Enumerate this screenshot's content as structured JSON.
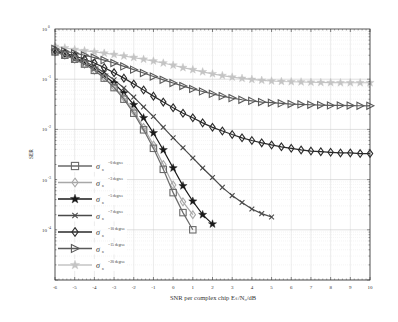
{
  "chart_data": {
    "type": "line",
    "title": "",
    "xlabel": "SNR per complex chip Eₛ/N₀/dB",
    "ylabel": "SER",
    "xlim": [
      -6,
      10
    ],
    "ylim": [
      1e-05,
      1
    ],
    "yscale": "log",
    "grid": true,
    "legend_position": "lower left",
    "x_ticks": [
      -6,
      -5,
      -4,
      -3,
      -2,
      -1,
      0,
      1,
      2,
      3,
      4,
      5,
      6,
      7,
      8,
      9,
      10
    ],
    "y_ticks": [
      {
        "value": 1,
        "label": "10",
        "exp": "0"
      },
      {
        "value": 0.1,
        "label": "10",
        "exp": "-1"
      },
      {
        "value": 0.01,
        "label": "10",
        "exp": "-2"
      },
      {
        "value": 0.001,
        "label": "10",
        "exp": "-3"
      },
      {
        "value": 0.0001,
        "label": "10",
        "exp": "-4"
      }
    ],
    "series": [
      {
        "name": "σₙ =0 degree",
        "sigma": "0",
        "marker": "square",
        "color": "#6a6a6a",
        "x": [
          -6,
          -5.5,
          -5,
          -4.5,
          -4,
          -3.5,
          -3,
          -2.5,
          -2,
          -1.5,
          -1,
          -0.5,
          0,
          0.5,
          1
        ],
        "values": [
          0.35,
          0.3,
          0.25,
          0.2,
          0.15,
          0.105,
          0.068,
          0.04,
          0.021,
          0.0098,
          0.0042,
          0.0016,
          0.00055,
          0.00022,
          0.0001
        ]
      },
      {
        "name": "σₙ =3 degree",
        "sigma": "3",
        "marker": "diamond",
        "color": "#a8a8a8",
        "x": [
          -6,
          -5.5,
          -5,
          -4.5,
          -4,
          -3.5,
          -3,
          -2.5,
          -2,
          -1.5,
          -1,
          -0.5,
          0,
          0.5,
          1
        ],
        "values": [
          0.35,
          0.3,
          0.25,
          0.2,
          0.15,
          0.108,
          0.071,
          0.043,
          0.023,
          0.011,
          0.0049,
          0.002,
          0.00078,
          0.00036,
          0.0002
        ]
      },
      {
        "name": "σₙ =5 degree",
        "sigma": "5",
        "marker": "star",
        "color": "#1a1a1a",
        "x": [
          -6,
          -5.5,
          -5,
          -4.5,
          -4,
          -3.5,
          -3,
          -2.5,
          -2,
          -1.5,
          -1,
          -0.5,
          0,
          0.5,
          1,
          1.5,
          2
        ],
        "values": [
          0.36,
          0.31,
          0.26,
          0.21,
          0.165,
          0.12,
          0.083,
          0.053,
          0.031,
          0.017,
          0.0085,
          0.0039,
          0.0017,
          0.00075,
          0.00037,
          0.0002,
          0.00013
        ]
      },
      {
        "name": "σₙ =7 degree",
        "sigma": "7",
        "marker": "x",
        "color": "#4a4a4a",
        "x": [
          -6,
          -5.5,
          -5,
          -4.5,
          -4,
          -3.5,
          -3,
          -2.5,
          -2,
          -1.5,
          -1,
          -0.5,
          0,
          0.5,
          1,
          1.5,
          2,
          2.5,
          3,
          3.5,
          4,
          4.5,
          5
        ],
        "values": [
          0.37,
          0.32,
          0.27,
          0.225,
          0.18,
          0.135,
          0.097,
          0.067,
          0.044,
          0.028,
          0.018,
          0.011,
          0.0068,
          0.0043,
          0.0027,
          0.0017,
          0.0011,
          0.0007,
          0.00048,
          0.00035,
          0.00026,
          0.00021,
          0.00018
        ]
      },
      {
        "name": "σₙ =10 degree",
        "sigma": "10",
        "marker": "diamond-open",
        "color": "#2a2a2a",
        "x": [
          -6,
          -5.5,
          -5,
          -4.5,
          -4,
          -3.5,
          -3,
          -2.5,
          -2,
          -1.5,
          -1,
          -0.5,
          0,
          0.5,
          1,
          1.5,
          2,
          2.5,
          3,
          3.5,
          4,
          4.5,
          5,
          5.5,
          6,
          6.5,
          7,
          7.5,
          8,
          8.5,
          9,
          9.5,
          10
        ],
        "values": [
          0.37,
          0.33,
          0.29,
          0.25,
          0.21,
          0.17,
          0.135,
          0.105,
          0.08,
          0.061,
          0.046,
          0.035,
          0.027,
          0.021,
          0.017,
          0.0135,
          0.011,
          0.0093,
          0.0079,
          0.0068,
          0.006,
          0.0054,
          0.0049,
          0.0045,
          0.0042,
          0.0039,
          0.0037,
          0.0036,
          0.0035,
          0.0034,
          0.0034,
          0.0033,
          0.0033
        ]
      },
      {
        "name": "σₙ =15 degree",
        "sigma": "15",
        "marker": "triangle-right",
        "color": "#5a5a5a",
        "x": [
          -6,
          -5.5,
          -5,
          -4.5,
          -4,
          -3.5,
          -3,
          -2.5,
          -2,
          -1.5,
          -1,
          -0.5,
          0,
          0.5,
          1,
          1.5,
          2,
          2.5,
          3,
          3.5,
          4,
          4.5,
          5,
          5.5,
          6,
          6.5,
          7,
          7.5,
          8,
          8.5,
          9,
          9.5,
          10
        ],
        "values": [
          0.4,
          0.36,
          0.33,
          0.3,
          0.27,
          0.24,
          0.21,
          0.18,
          0.155,
          0.133,
          0.113,
          0.097,
          0.084,
          0.073,
          0.064,
          0.057,
          0.051,
          0.046,
          0.042,
          0.039,
          0.037,
          0.035,
          0.034,
          0.033,
          0.032,
          0.0315,
          0.031,
          0.0305,
          0.03,
          0.03,
          0.0298,
          0.0296,
          0.0295
        ]
      },
      {
        "name": "σₙ =20 degree",
        "sigma": "20",
        "marker": "star",
        "color": "#c4c4c4",
        "x": [
          -6,
          -5.5,
          -5,
          -4.5,
          -4,
          -3.5,
          -3,
          -2.5,
          -2,
          -1.5,
          -1,
          -0.5,
          0,
          0.5,
          1,
          1.5,
          2,
          2.5,
          3,
          3.5,
          4,
          4.5,
          5,
          5.5,
          6,
          6.5,
          7,
          7.5,
          8,
          8.5,
          9,
          9.5,
          10
        ],
        "values": [
          0.45,
          0.42,
          0.39,
          0.37,
          0.35,
          0.33,
          0.31,
          0.29,
          0.27,
          0.25,
          0.23,
          0.21,
          0.19,
          0.17,
          0.155,
          0.14,
          0.128,
          0.118,
          0.11,
          0.104,
          0.099,
          0.095,
          0.092,
          0.09,
          0.089,
          0.088,
          0.087,
          0.086,
          0.0855,
          0.085,
          0.085,
          0.085,
          0.085
        ]
      }
    ]
  },
  "legend": {
    "entries": [
      {
        "symbol": "σ",
        "sub": "n",
        "text": "=0 degree"
      },
      {
        "symbol": "σ",
        "sub": "n",
        "text": "=3 degree"
      },
      {
        "symbol": "σ",
        "sub": "n",
        "text": "=5 degree"
      },
      {
        "symbol": "σ",
        "sub": "n",
        "text": "=7 degree"
      },
      {
        "symbol": "σ",
        "sub": "n",
        "text": "=10 degree"
      },
      {
        "symbol": "σ",
        "sub": "n",
        "text": "=15 degree"
      },
      {
        "symbol": "σ",
        "sub": "n",
        "text": "=20 degree"
      }
    ]
  },
  "axes": {
    "xlabel": "SNR per complex chip Eₛ/N₀/dB",
    "ylabel": "SER"
  }
}
